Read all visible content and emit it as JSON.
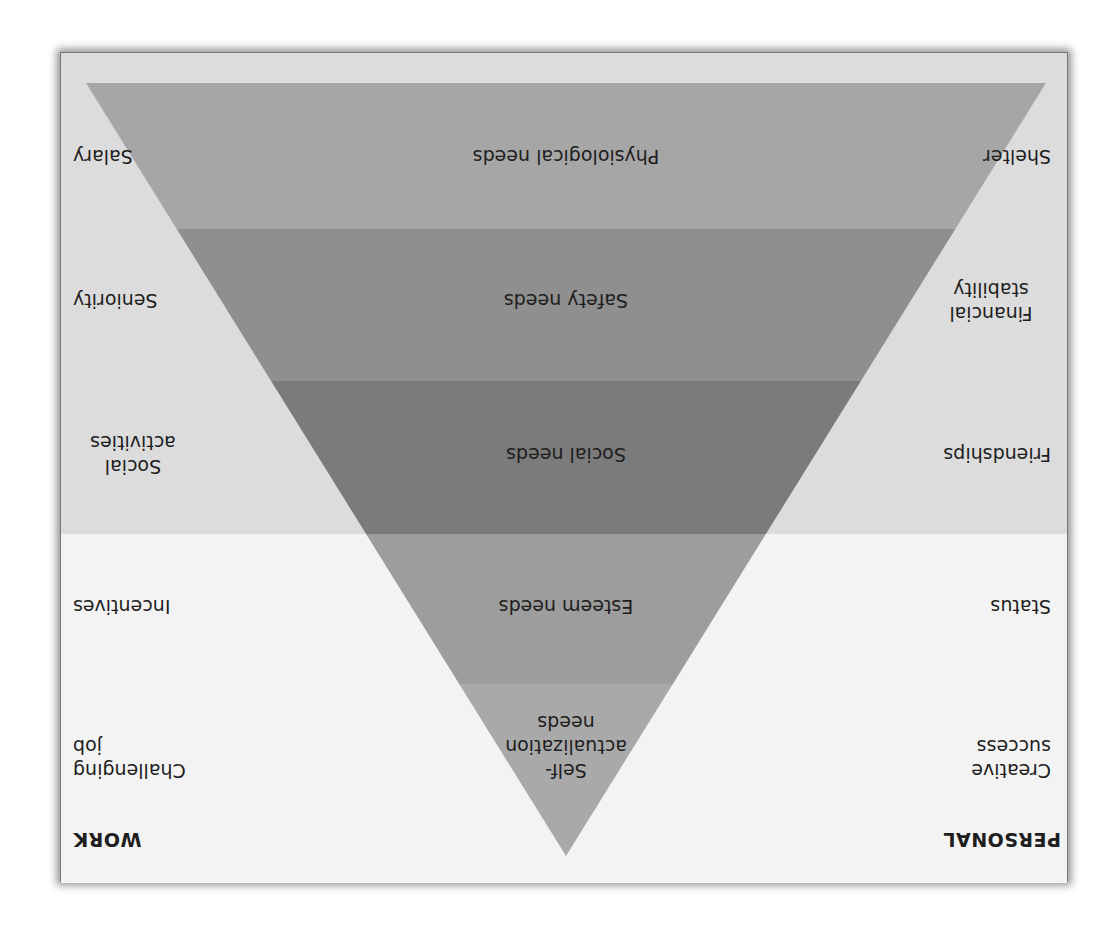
{
  "diagram": {
    "orientation": "rotated 180 degrees (upside-down)",
    "columns": {
      "personal_header": "PERSONAL",
      "work_header": "WORK"
    },
    "levels": [
      {
        "need": "Self-\nactualization\nneeds",
        "personal": "Creative\nsuccess",
        "work": "Challenging\njob",
        "color": "#a9a9a9"
      },
      {
        "need": "Esteem needs",
        "personal": "Status",
        "work": "Incentives",
        "color": "#9d9d9d"
      },
      {
        "need": "Social needs",
        "personal": "Friendships",
        "work": "Social\nactivities",
        "color": "#7b7b7b"
      },
      {
        "need": "Safety needs",
        "personal": "Financial\nstability",
        "work": "Seniority",
        "color": "#8f8f8f"
      },
      {
        "need": "Physiological needs",
        "personal": "Shelter",
        "work": "Salary",
        "color": "#a6a6a6"
      }
    ],
    "colors": {
      "upper_background": "#dcdcdc",
      "lower_background": "#f3f3f3",
      "text": "#1e1e1e"
    }
  }
}
